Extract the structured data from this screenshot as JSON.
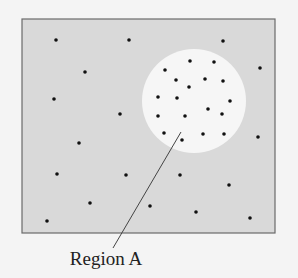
{
  "diagram": {
    "colors": {
      "page_background": "#f4f4f4",
      "box_fill": "#d9d9d9",
      "box_stroke": "#6a6a6a",
      "region_fill": "#f6f6f6",
      "dot_color": "#111111",
      "leader_color": "#444444",
      "label_color": "#222222"
    },
    "box": {
      "x": 22,
      "y": 19,
      "width": 253,
      "height": 214
    },
    "region": {
      "cx": 194,
      "cy": 101,
      "r": 52
    },
    "outside_points": [
      [
        56,
        40
      ],
      [
        129,
        40
      ],
      [
        223,
        41
      ],
      [
        260,
        68
      ],
      [
        85,
        72
      ],
      [
        54,
        99
      ],
      [
        120,
        114
      ],
      [
        258,
        137
      ],
      [
        79,
        143
      ],
      [
        57,
        174
      ],
      [
        126,
        175
      ],
      [
        180,
        175
      ],
      [
        229,
        185
      ],
      [
        90,
        203
      ],
      [
        150,
        206
      ],
      [
        196,
        212
      ],
      [
        250,
        218
      ],
      [
        47,
        221
      ]
    ],
    "inside_points": [
      [
        190,
        61
      ],
      [
        214,
        62
      ],
      [
        165,
        70
      ],
      [
        176,
        80
      ],
      [
        205,
        79
      ],
      [
        223,
        81
      ],
      [
        189,
        87
      ],
      [
        158,
        97
      ],
      [
        177,
        98
      ],
      [
        230,
        101
      ],
      [
        208,
        109
      ],
      [
        158,
        116
      ],
      [
        185,
        116
      ],
      [
        222,
        114
      ],
      [
        164,
        133
      ],
      [
        182,
        140
      ],
      [
        203,
        134
      ],
      [
        224,
        134
      ]
    ],
    "leader": {
      "x1": 181,
      "y1": 132,
      "x2": 113,
      "y2": 248
    },
    "label": {
      "text": "Region A",
      "x": 106,
      "y": 265
    }
  }
}
